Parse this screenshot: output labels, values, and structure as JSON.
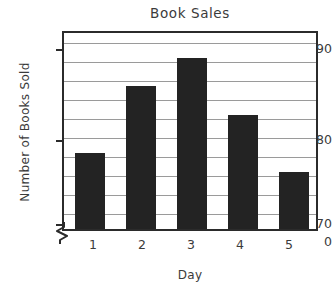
{
  "chart_data": {
    "type": "bar",
    "title": "Book Sales",
    "xlabel": "Day",
    "ylabel": "Number of Books Sold",
    "categories": [
      "1",
      "2",
      "3",
      "4",
      "5"
    ],
    "values": [
      78,
      85,
      88,
      82,
      76
    ],
    "ylim": [
      70,
      91
    ],
    "y_axis_broken": true,
    "y_break_from": 0,
    "y_break_to": 70,
    "yticks_labeled": [
      "0",
      "70",
      "80",
      "90"
    ],
    "gridline_interval": 2,
    "grid": true,
    "legend": "none",
    "bar_color": "#232323",
    "grid_color": "#9a9a9a",
    "axis_color": "#2b2b2b",
    "background_color": "#ffffff",
    "series": [
      {
        "name": "Number of Books Sold",
        "points": [
          {
            "day": "1",
            "value": 78
          },
          {
            "day": "2",
            "value": 85
          },
          {
            "day": "3",
            "value": 88
          },
          {
            "day": "4",
            "value": 82
          },
          {
            "day": "5",
            "value": 76
          }
        ]
      }
    ]
  },
  "axis": {
    "y_labels": [
      {
        "text": "90",
        "top": 41
      },
      {
        "text": "80",
        "top": 132
      },
      {
        "text": "70",
        "top": 216
      },
      {
        "text": "0",
        "top": 234
      }
    ],
    "x_labels": [
      {
        "text": "1",
        "left": 73
      },
      {
        "text": "2",
        "left": 122
      },
      {
        "text": "3",
        "left": 171
      },
      {
        "text": "4",
        "left": 220
      },
      {
        "text": "5",
        "left": 269
      }
    ]
  },
  "icons": {
    "axis_break": "axis-break-zigzag-icon"
  }
}
